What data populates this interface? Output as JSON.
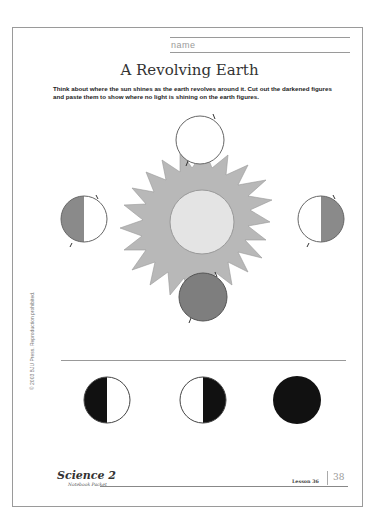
{
  "header": {
    "name_label": "name",
    "title": "A Revolving Earth",
    "instructions": "Think about where the sun shines as the earth revolves around it. Cut out the darkened figures and paste them to show where no light is shining on the earth figures."
  },
  "diagram": {
    "sun": {
      "label": "sun",
      "ray_color": "#b8b8b8",
      "core_color": "#e4e4e4"
    },
    "earths": [
      {
        "position": "top",
        "shaded": "none"
      },
      {
        "position": "left",
        "shaded": "left-half"
      },
      {
        "position": "right",
        "shaded": "right-half"
      },
      {
        "position": "bottom",
        "shaded": "full"
      }
    ],
    "shade_color": "#8a8a8a"
  },
  "cutouts": [
    {
      "id": "cutout-left-dark",
      "shaded": "left-half"
    },
    {
      "id": "cutout-right-dark",
      "shaded": "right-half"
    },
    {
      "id": "cutout-full-dark",
      "shaded": "full"
    }
  ],
  "side_text": "© 2003 BJU Press. Reproduction prohibited.",
  "footer": {
    "logo": "Science 2",
    "logo_sub": "Notebook Packet",
    "lesson": "Lesson 36",
    "page_number": "38"
  }
}
